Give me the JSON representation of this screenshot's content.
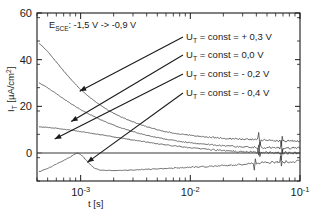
{
  "chart_data": {
    "type": "line",
    "title": "",
    "xlabel": "t [s]",
    "ylabel": "I_T [µA/cm²]",
    "ylabel_parts": {
      "base": "I",
      "sub": "T",
      "unit_open": " [µA/cm",
      "sup": "2",
      "unit_close": "]"
    },
    "xscale": "log",
    "xlim": [
      0.0004,
      0.1
    ],
    "ylim": [
      -12,
      60
    ],
    "grid": false,
    "legend_position": "inside-top-right",
    "xticks": [
      {
        "value": 0.001,
        "mantissa": "10",
        "exponent": "-3"
      },
      {
        "value": 0.01,
        "mantissa": "10",
        "exponent": "-2"
      },
      {
        "value": 0.1,
        "mantissa": "10",
        "exponent": "-1"
      }
    ],
    "yticks": [
      {
        "value": 0,
        "label": "0"
      },
      {
        "value": 20,
        "label": "20"
      },
      {
        "value": 40,
        "label": "40"
      },
      {
        "value": 60,
        "label": "60"
      }
    ],
    "annotation": {
      "base": "E",
      "sub": "SCE",
      "text": ": -1,5 V -> -0,9 V"
    },
    "series": [
      {
        "name": "U_T = const = + 0,3 V",
        "legend_prefix": "U",
        "legend_sub": "T",
        "legend_rest": " = const = + 0,3 V",
        "points": [
          [
            0.00042,
            47.0
          ],
          [
            0.0005,
            43.5
          ],
          [
            0.0006,
            39.0
          ],
          [
            0.0007,
            35.2
          ],
          [
            0.0008,
            32.0
          ],
          [
            0.0009,
            29.4
          ],
          [
            0.001,
            27.2
          ],
          [
            0.0012,
            24.0
          ],
          [
            0.0015,
            20.6
          ],
          [
            0.0018,
            18.2
          ],
          [
            0.0022,
            16.0
          ],
          [
            0.0027,
            14.2
          ],
          [
            0.0033,
            12.6
          ],
          [
            0.004,
            11.3
          ],
          [
            0.005,
            10.0
          ],
          [
            0.006,
            9.1
          ],
          [
            0.007,
            8.6
          ],
          [
            0.008,
            8.1
          ],
          [
            0.009,
            7.9
          ],
          [
            0.01,
            7.6
          ],
          [
            0.012,
            7.2
          ],
          [
            0.015,
            6.8
          ],
          [
            0.018,
            6.5
          ],
          [
            0.022,
            6.2
          ],
          [
            0.027,
            6.0
          ],
          [
            0.033,
            5.8
          ],
          [
            0.04,
            5.6
          ],
          [
            0.05,
            5.5
          ],
          [
            0.06,
            5.4
          ],
          [
            0.07,
            5.3
          ],
          [
            0.085,
            5.2
          ],
          [
            0.1,
            5.2
          ]
        ]
      },
      {
        "name": "U_T = const =  0,0  V",
        "legend_prefix": "U",
        "legend_sub": "T",
        "legend_rest": " = const =   0,0  V",
        "points": [
          [
            0.00042,
            30.0
          ],
          [
            0.0005,
            28.0
          ],
          [
            0.0006,
            25.4
          ],
          [
            0.0007,
            23.2
          ],
          [
            0.0008,
            21.4
          ],
          [
            0.0009,
            19.9
          ],
          [
            0.001,
            18.6
          ],
          [
            0.0012,
            16.6
          ],
          [
            0.0015,
            14.4
          ],
          [
            0.0018,
            12.8
          ],
          [
            0.0022,
            11.2
          ],
          [
            0.0027,
            9.8
          ],
          [
            0.0033,
            8.6
          ],
          [
            0.004,
            7.6
          ],
          [
            0.005,
            6.6
          ],
          [
            0.006,
            5.9
          ],
          [
            0.007,
            5.4
          ],
          [
            0.008,
            5.0
          ],
          [
            0.009,
            4.7
          ],
          [
            0.01,
            4.4
          ],
          [
            0.012,
            4.0
          ],
          [
            0.015,
            3.6
          ],
          [
            0.018,
            3.3
          ],
          [
            0.022,
            3.0
          ],
          [
            0.027,
            2.8
          ],
          [
            0.033,
            2.6
          ],
          [
            0.04,
            2.4
          ],
          [
            0.05,
            2.3
          ],
          [
            0.06,
            2.2
          ],
          [
            0.07,
            2.1
          ],
          [
            0.085,
            2.1
          ],
          [
            0.1,
            2.0
          ]
        ]
      },
      {
        "name": "U_T = const = - 0,2 V",
        "legend_prefix": "U",
        "legend_sub": "T",
        "legend_rest": " = const = - 0,2 V",
        "points": [
          [
            0.00042,
            11.2
          ],
          [
            0.0005,
            11.0
          ],
          [
            0.0006,
            10.6
          ],
          [
            0.0007,
            10.2
          ],
          [
            0.0008,
            9.8
          ],
          [
            0.0009,
            9.5
          ],
          [
            0.001,
            9.2
          ],
          [
            0.0012,
            8.6
          ],
          [
            0.0015,
            7.9
          ],
          [
            0.0018,
            7.3
          ],
          [
            0.0022,
            6.6
          ],
          [
            0.0027,
            5.9
          ],
          [
            0.0033,
            5.3
          ],
          [
            0.004,
            4.7
          ],
          [
            0.005,
            4.0
          ],
          [
            0.006,
            3.5
          ],
          [
            0.007,
            3.1
          ],
          [
            0.008,
            2.8
          ],
          [
            0.009,
            2.5
          ],
          [
            0.01,
            2.3
          ],
          [
            0.012,
            1.9
          ],
          [
            0.015,
            1.5
          ],
          [
            0.018,
            1.2
          ],
          [
            0.022,
            0.9
          ],
          [
            0.027,
            0.7
          ],
          [
            0.033,
            0.5
          ],
          [
            0.04,
            0.3
          ],
          [
            0.05,
            0.2
          ],
          [
            0.06,
            0.1
          ],
          [
            0.07,
            0.05
          ],
          [
            0.085,
            0.0
          ],
          [
            0.1,
            0.0
          ]
        ]
      },
      {
        "name": "U_T = const = - 0,4  V",
        "legend_prefix": "U",
        "legend_sub": "T",
        "legend_rest": " = const = - 0,4  V",
        "points": [
          [
            0.00042,
            -8.0
          ],
          [
            0.0005,
            -6.6
          ],
          [
            0.0006,
            -4.8
          ],
          [
            0.0007,
            -3.2
          ],
          [
            0.0008,
            -1.8
          ],
          [
            0.00088,
            -0.6
          ],
          [
            0.00095,
            0.1
          ],
          [
            0.00105,
            -1.6
          ],
          [
            0.00115,
            -3.6
          ],
          [
            0.00125,
            -5.4
          ],
          [
            0.00135,
            -6.6
          ],
          [
            0.0015,
            -7.3
          ],
          [
            0.0018,
            -7.5
          ],
          [
            0.0022,
            -7.5
          ],
          [
            0.0027,
            -7.4
          ],
          [
            0.0033,
            -7.2
          ],
          [
            0.004,
            -7.0
          ],
          [
            0.005,
            -6.8
          ],
          [
            0.006,
            -6.6
          ],
          [
            0.007,
            -6.5
          ],
          [
            0.008,
            -6.3
          ],
          [
            0.009,
            -6.2
          ],
          [
            0.01,
            -6.1
          ],
          [
            0.012,
            -6.0
          ],
          [
            0.015,
            -5.8
          ],
          [
            0.018,
            -5.6
          ],
          [
            0.022,
            -5.3
          ],
          [
            0.027,
            -5.0
          ],
          [
            0.033,
            -4.7
          ],
          [
            0.04,
            -4.4
          ],
          [
            0.05,
            -4.1
          ],
          [
            0.06,
            -3.9
          ],
          [
            0.07,
            -3.8
          ],
          [
            0.085,
            -3.7
          ],
          [
            0.1,
            -3.6
          ]
        ]
      }
    ],
    "legend_entries": [
      {
        "prefix": "U",
        "sub": "T",
        "rest": " = const = + 0,3 V"
      },
      {
        "prefix": "U",
        "sub": "T",
        "rest": " = const =   0,0  V"
      },
      {
        "prefix": "U",
        "sub": "T",
        "rest": " = const = - 0,2 V"
      },
      {
        "prefix": "U",
        "sub": "T",
        "rest": " = const = - 0,4  V"
      }
    ]
  }
}
